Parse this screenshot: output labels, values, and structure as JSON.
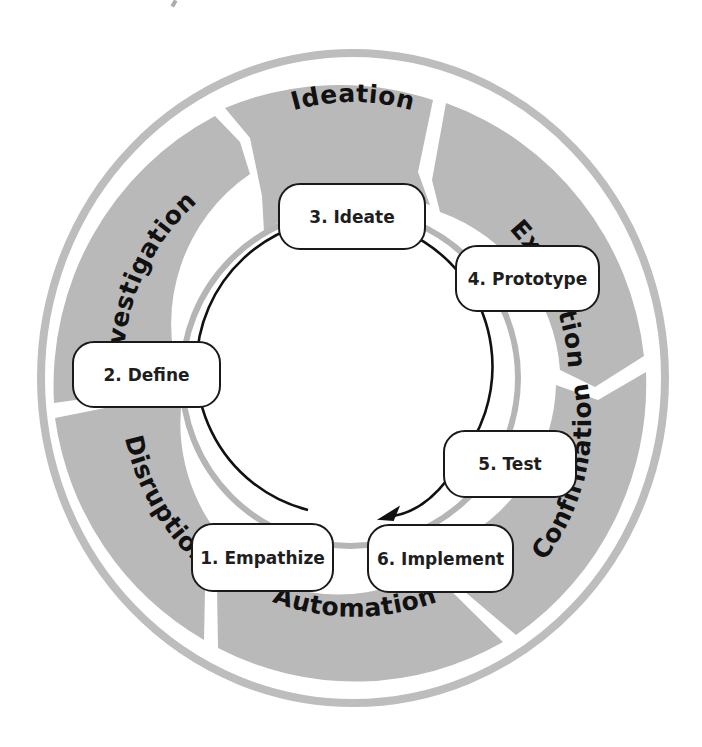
{
  "diagram": {
    "title": "",
    "colors": {
      "outer_band": "#b9b9b9",
      "outer_ring": "#bdbdbd",
      "inner_ring": "#b5b5b5",
      "cycle_line": "#111111",
      "box_border": "#1a1a1a",
      "box_fill": "#ffffff",
      "text": "#111111"
    },
    "phases": [
      {
        "label": "Ideation"
      },
      {
        "label": "Expedition"
      },
      {
        "label": "Confirmation"
      },
      {
        "label": "Automation"
      },
      {
        "label": "Disruption"
      },
      {
        "label": "Investigation"
      }
    ],
    "steps": [
      {
        "label": "1. Empathize"
      },
      {
        "label": "2. Define"
      },
      {
        "label": "3. Ideate"
      },
      {
        "label": "4. Prototype"
      },
      {
        "label": "5. Test"
      },
      {
        "label": "6. Implement"
      }
    ],
    "cycle_arrow": {
      "direction": "clockwise",
      "from": "5. Test",
      "to": "6. Implement",
      "icon": "arrow-head-icon"
    }
  }
}
